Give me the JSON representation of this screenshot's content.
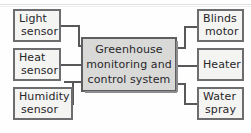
{
  "diagram": {
    "type": "block-diagram",
    "colors": {
      "border": "#6d6d70",
      "center_fill": "#d9d9d7",
      "peripheral_fill": "#f4f4f2",
      "wire": "#58585a",
      "text": "#27272a"
    },
    "center": {
      "name": "greenhouse-controller",
      "line1": "Greenhouse",
      "line2": "monitoring and",
      "line3": "control system"
    },
    "inputs": [
      {
        "name": "light-sensor",
        "line1": "Light",
        "line2": "sensor"
      },
      {
        "name": "heat-sensor",
        "line1": "Heat",
        "line2": "sensor"
      },
      {
        "name": "humidity-sensor",
        "line1": "Humidity",
        "line2": "sensor"
      }
    ],
    "outputs": [
      {
        "name": "blinds-motor",
        "line1": "Blinds",
        "line2": "motor"
      },
      {
        "name": "heater",
        "line1": "Heater",
        "line2": ""
      },
      {
        "name": "water-spray",
        "line1": "Water",
        "line2": "spray"
      }
    ]
  }
}
